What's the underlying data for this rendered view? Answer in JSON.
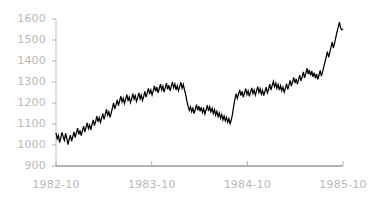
{
  "chart_data": {
    "type": "line",
    "title": "",
    "subtitle": "",
    "xlabel": "",
    "ylabel": "",
    "xlim": [
      "1982-10",
      "1985-10"
    ],
    "ylim": [
      900,
      1600
    ],
    "grid": false,
    "legend": null,
    "legend_position": "none",
    "line_color": "#000000",
    "axis_color": "#b0b0b0",
    "tick_label_color": "#b9b9b9",
    "background_color": "#ffffff",
    "y_ticks": [
      900,
      1000,
      1100,
      1200,
      1300,
      1400,
      1500,
      1600
    ],
    "y_tick_labels": [
      "900",
      "1000",
      "1100",
      "1200",
      "1300",
      "1400",
      "1500",
      "1600"
    ],
    "x_ticks": [
      "1982-10",
      "1983-10",
      "1984-10",
      "1985-10"
    ],
    "x_tick_labels": [
      "1982-10",
      "1983-10",
      "1984-10",
      "1985-10"
    ],
    "series": [
      {
        "name": "index",
        "x_start": "1982-10",
        "x_end": "1985-10",
        "values": [
          1058,
          1030,
          1045,
          1012,
          1035,
          1060,
          1038,
          1022,
          1055,
          1030,
          1002,
          1028,
          1047,
          1018,
          1040,
          1062,
          1035,
          1058,
          1080,
          1050,
          1070,
          1045,
          1068,
          1090,
          1062,
          1085,
          1105,
          1078,
          1095,
          1072,
          1098,
          1120,
          1092,
          1112,
          1138,
          1110,
          1130,
          1108,
          1128,
          1150,
          1122,
          1145,
          1170,
          1142,
          1158,
          1132,
          1152,
          1178,
          1200,
          1172,
          1192,
          1215,
          1188,
          1210,
          1232,
          1205,
          1222,
          1198,
          1218,
          1240,
          1212,
          1228,
          1202,
          1220,
          1245,
          1218,
          1235,
          1208,
          1225,
          1248,
          1220,
          1238,
          1212,
          1230,
          1255,
          1228,
          1248,
          1270,
          1242,
          1262,
          1238,
          1258,
          1282,
          1255,
          1275,
          1248,
          1268,
          1290,
          1262,
          1280,
          1252,
          1272,
          1295,
          1265,
          1285,
          1258,
          1278,
          1300,
          1272,
          1290,
          1262,
          1282,
          1258,
          1278,
          1298,
          1270,
          1288,
          1262,
          1240,
          1210,
          1185,
          1165,
          1182,
          1158,
          1175,
          1150,
          1170,
          1192,
          1165,
          1185,
          1160,
          1180,
          1155,
          1172,
          1148,
          1168,
          1190,
          1162,
          1182,
          1158,
          1175,
          1150,
          1168,
          1142,
          1160,
          1135,
          1152,
          1128,
          1145,
          1120,
          1138,
          1115,
          1132,
          1108,
          1125,
          1102,
          1120,
          1148,
          1185,
          1218,
          1245,
          1222,
          1242,
          1262,
          1235,
          1255,
          1228,
          1248,
          1268,
          1240,
          1258,
          1232,
          1252,
          1272,
          1245,
          1262,
          1238,
          1258,
          1278,
          1250,
          1268,
          1242,
          1260,
          1235,
          1255,
          1275,
          1248,
          1265,
          1290,
          1262,
          1282,
          1302,
          1278,
          1295,
          1270,
          1288,
          1262,
          1282,
          1258,
          1275,
          1252,
          1270,
          1292,
          1265,
          1285,
          1308,
          1280,
          1300,
          1322,
          1295,
          1315,
          1290,
          1310,
          1332,
          1305,
          1325,
          1348,
          1320,
          1340,
          1365,
          1338,
          1358,
          1332,
          1352,
          1325,
          1345,
          1318,
          1338,
          1312,
          1332,
          1355,
          1328,
          1348,
          1372,
          1395,
          1420,
          1445,
          1418,
          1440,
          1465,
          1490,
          1462,
          1485,
          1512,
          1538,
          1560,
          1585,
          1558,
          1548,
          1552
        ]
      }
    ]
  }
}
